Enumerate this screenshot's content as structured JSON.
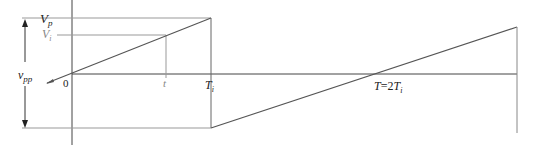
{
  "diagram": {
    "type": "sawtooth-waveform",
    "labels": {
      "vp": "V",
      "vp_sub": "p",
      "vi": "V",
      "vi_sub": "i",
      "vpp": "v",
      "vpp_sub": "pp",
      "origin": "0",
      "t": "t",
      "ti": "T",
      "ti_sub": "i",
      "period_prefix": "T",
      "period_eq": "=2",
      "period_T": "T",
      "period_sub": "i"
    },
    "colors": {
      "line_dark": "#444444",
      "line_light": "#999999",
      "text": "#222222",
      "text_light": "#888888"
    }
  }
}
